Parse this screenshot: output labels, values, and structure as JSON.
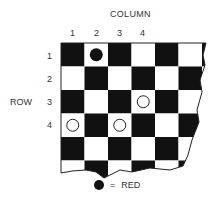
{
  "column_title": "COLUMN",
  "row_title": "ROW",
  "column_labels": [
    "1",
    "2",
    "3",
    "4"
  ],
  "row_labels": [
    "1",
    "2",
    "3",
    "4"
  ],
  "colors": {
    "dark": "#111111",
    "light": "#ffffff",
    "red_piece_display": "#111111"
  },
  "board": {
    "first_square_dark": true,
    "pieces": [
      {
        "row": 1,
        "col": 2,
        "type": "red",
        "filled": true
      },
      {
        "row": 3,
        "col": 4,
        "type": "other",
        "filled": false
      },
      {
        "row": 4,
        "col": 1,
        "type": "other",
        "filled": false
      },
      {
        "row": 4,
        "col": 3,
        "type": "other",
        "filled": false
      }
    ]
  },
  "legend": {
    "symbol": "filled-circle",
    "equals": "=",
    "label": "RED"
  }
}
